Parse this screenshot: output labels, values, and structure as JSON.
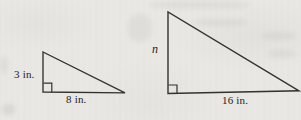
{
  "figure": {
    "small_triangle": {
      "height_label": "3 in.",
      "base_label": "8 in."
    },
    "large_triangle": {
      "height_label": "n",
      "base_label": "16 in."
    },
    "colors": {
      "background": "#e9e8e4",
      "line": "#35322c",
      "text": "#25221d"
    }
  }
}
